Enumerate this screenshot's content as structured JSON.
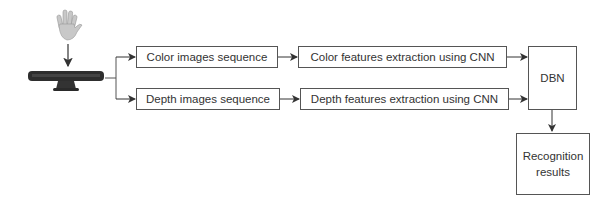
{
  "diagram": {
    "input": {
      "hand_icon": "hand-icon",
      "sensor_icon": "kinect-sensor-icon"
    },
    "nodes": {
      "color_seq": "Color images sequence",
      "depth_seq": "Depth images sequence",
      "color_feat": "Color features extraction using CNN",
      "depth_feat": "Depth features extraction using CNN",
      "dbn": "DBN",
      "result_line1": "Recognition",
      "result_line2": "results"
    },
    "edges": [
      [
        "hand",
        "sensor"
      ],
      [
        "sensor",
        "color_seq"
      ],
      [
        "sensor",
        "depth_seq"
      ],
      [
        "color_seq",
        "color_feat"
      ],
      [
        "depth_seq",
        "depth_feat"
      ],
      [
        "color_feat",
        "dbn"
      ],
      [
        "depth_feat",
        "dbn"
      ],
      [
        "dbn",
        "results"
      ]
    ]
  }
}
